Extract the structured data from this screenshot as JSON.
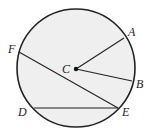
{
  "diagram": {
    "type": "circle-geometry",
    "colors": {
      "fill": "#efefef",
      "stroke": "#222222",
      "background": "#ffffff"
    },
    "circle": {
      "cx": 76,
      "cy": 68,
      "r": 59
    },
    "center": {
      "label": "C",
      "x": 76,
      "y": 69,
      "label_x": 62,
      "label_y": 73
    },
    "points": [
      {
        "label": "A",
        "x": 124,
        "y": 38,
        "label_x": 128,
        "label_y": 36
      },
      {
        "label": "B",
        "x": 132,
        "y": 81,
        "label_x": 136,
        "label_y": 88
      },
      {
        "label": "D",
        "x": 34,
        "y": 108,
        "label_x": 18,
        "label_y": 116
      },
      {
        "label": "E",
        "x": 118,
        "y": 108,
        "label_x": 122,
        "label_y": 116
      },
      {
        "label": "F",
        "x": 19,
        "y": 52,
        "label_x": 8,
        "label_y": 53
      }
    ],
    "segments": [
      {
        "name": "radius-CA",
        "from": "C",
        "to": "A"
      },
      {
        "name": "radius-CB",
        "from": "C",
        "to": "B"
      },
      {
        "name": "chord-FE",
        "from": "F",
        "to": "E"
      },
      {
        "name": "chord-DE",
        "from": "D",
        "to": "E"
      }
    ]
  }
}
